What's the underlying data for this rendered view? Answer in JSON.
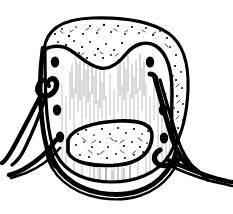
{
  "figure": {
    "title": "Laced helmet line drawing",
    "medium": "black ink line art on white paper",
    "canvas": {
      "width": 233,
      "height": 214,
      "background": "#ffffff",
      "ink": "#000000"
    },
    "caption": ""
  },
  "parts": [
    {
      "id": "helmet-body",
      "label": "Helmet body",
      "description": "Rounded dome-shaped shell with vertical hatch shading",
      "fill": "#ffffff",
      "outline": "#000000",
      "outline_weight": 3.2
    },
    {
      "id": "fleece-trim",
      "label": "Fleece trim band",
      "description": "Stippled textured band running across the crown and down the right side",
      "texture": "stipple",
      "fill": "#ffffff",
      "outline": "#000000",
      "outline_weight": 3.0
    },
    {
      "id": "chin-pad",
      "label": "Chin pad",
      "description": "Stippled oval pad at lower center of the shell",
      "texture": "stipple",
      "fill": "#ffffff",
      "outline": "#000000",
      "outline_weight": 3.4
    },
    {
      "id": "lace-left",
      "label": "Left lace",
      "description": "Thick cord threaded through left eyelets, trailing off to the lower left",
      "fill": "#000000"
    },
    {
      "id": "lace-right",
      "label": "Right lace",
      "description": "Thick cord threaded through right eyelets, trailing off to the lower right",
      "fill": "#000000"
    },
    {
      "id": "chin-strap",
      "label": "Chin strap",
      "description": "Curved band sweeping beneath the lower edge of the shell",
      "fill": "#000000"
    }
  ],
  "eyelets": {
    "label": "Lace eyelets",
    "shape": "filled-oval",
    "color": "#000000",
    "left": [
      {
        "cx": 55,
        "cy": 62,
        "rx": 4.2,
        "ry": 5.6
      },
      {
        "cx": 57,
        "cy": 110,
        "rx": 4.2,
        "ry": 5.6
      },
      {
        "cx": 60,
        "cy": 137,
        "rx": 4.2,
        "ry": 5.6
      }
    ],
    "right": [
      {
        "cx": 150,
        "cy": 62,
        "rx": 4.2,
        "ry": 5.6
      },
      {
        "cx": 163,
        "cy": 110,
        "rx": 4.2,
        "ry": 5.6
      },
      {
        "cx": 164,
        "cy": 138,
        "rx": 4.2,
        "ry": 5.6
      }
    ]
  },
  "colors": {
    "ink": "#000000",
    "paper": "#ffffff",
    "hatch": "#8e8e8e"
  }
}
